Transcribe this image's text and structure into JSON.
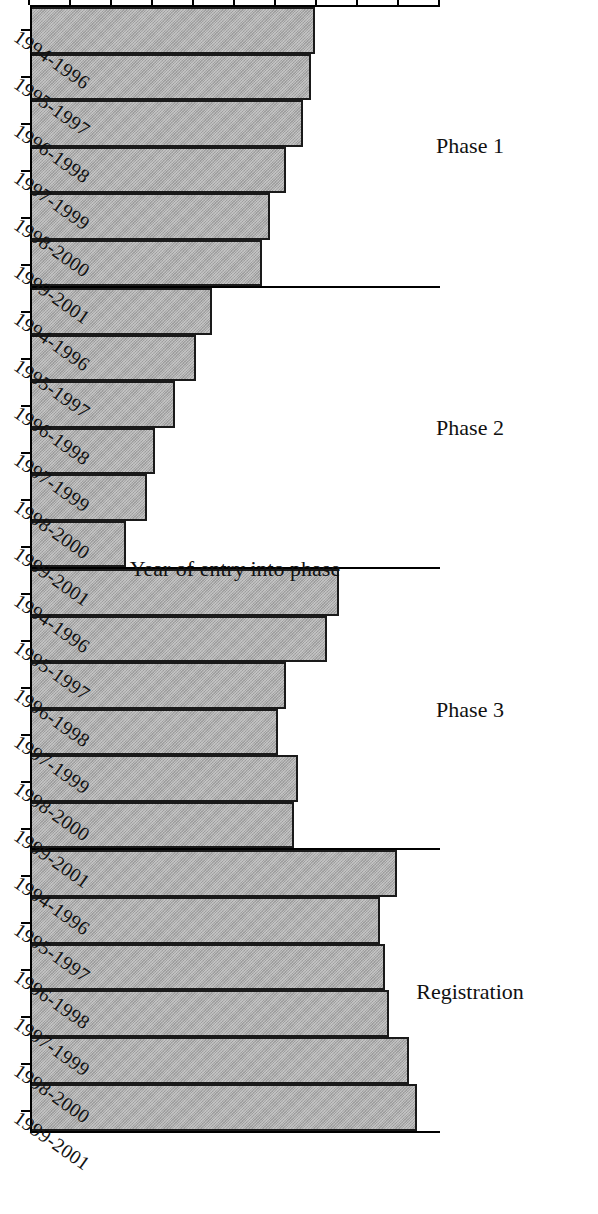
{
  "chart_data": {
    "type": "bar",
    "title": "",
    "xlabel": "Year of entry into phase",
    "ylabel": "Success rate (%)",
    "ylim": [
      0,
      100
    ],
    "grid": false,
    "legend": null,
    "orientation": "vertical-bars-rotated-90deg-ccw-on-page",
    "bar_color": "#a9a9a9",
    "bar_edge_color": "#1a1a1a",
    "ytick_labels": [
      "0",
      "10",
      "20",
      "30",
      "40",
      "50",
      "60",
      "70",
      "80",
      "90",
      "100"
    ],
    "ytick_values": [
      0,
      10,
      20,
      30,
      40,
      50,
      60,
      70,
      80,
      90,
      100
    ],
    "categories": [
      "1994-1996",
      "1995-1997",
      "1996-1998",
      "1997-1999",
      "1998-2000",
      "1999-2001"
    ],
    "groups": [
      {
        "name": "Phase 1",
        "categories": [
          "1994-1996",
          "1995-1997",
          "1996-1998",
          "1997-1999",
          "1998-2000",
          "1999-2001"
        ],
        "values": [
          69,
          68,
          66,
          62,
          58,
          56
        ]
      },
      {
        "name": "Phase 2",
        "categories": [
          "1994-1996",
          "1995-1997",
          "1996-1998",
          "1997-1999",
          "1998-2000",
          "1999-2001"
        ],
        "values": [
          44,
          40,
          35,
          30,
          28,
          23
        ]
      },
      {
        "name": "Phase 3",
        "categories": [
          "1994-1996",
          "1995-1997",
          "1996-1998",
          "1997-1999",
          "1998-2000",
          "1999-2001"
        ],
        "values": [
          75,
          72,
          62,
          60,
          65,
          64
        ]
      },
      {
        "name": "Registration",
        "categories": [
          "1994-1996",
          "1995-1997",
          "1996-1998",
          "1997-1999",
          "1998-2000",
          "1999-2001"
        ],
        "values": [
          89,
          85,
          86,
          87,
          92,
          94
        ]
      }
    ]
  },
  "axis": {
    "value_title": "Success rate (%)",
    "category_title": "Year of entry into phase"
  }
}
